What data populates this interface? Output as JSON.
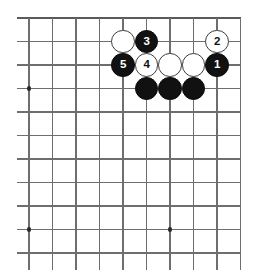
{
  "board": {
    "kind": "go-board-diagram",
    "title": "Go joseki diagram",
    "grid": {
      "columns": 10,
      "rows": 11,
      "origin_x": 29,
      "origin_y": 18,
      "spacing": 23.5,
      "line_color": "#6e6e6e",
      "edge_color": "#5a5a5a",
      "background": "#ffffff"
    },
    "star_points": [
      {
        "col": 0,
        "row": 3
      },
      {
        "col": 0,
        "row": 9
      },
      {
        "col": 6,
        "row": 9
      }
    ],
    "colors": {
      "black_stone": "#111111",
      "white_stone": "#ffffff",
      "white_stone_border": "#3d3d3d",
      "black_label": "#ffffff",
      "white_label": "#111111"
    },
    "stone_radius": 11.8,
    "stones": [
      {
        "id": "stone-w-c4r1",
        "color": "white",
        "label": "",
        "col": 4,
        "row": 1
      },
      {
        "id": "stone-b-3",
        "color": "black",
        "label": "3",
        "col": 5,
        "row": 1
      },
      {
        "id": "stone-w-2",
        "color": "white",
        "label": "2",
        "col": 8,
        "row": 1
      },
      {
        "id": "stone-b-5",
        "color": "black",
        "label": "5",
        "col": 4,
        "row": 2
      },
      {
        "id": "stone-w-4",
        "color": "white",
        "label": "4",
        "col": 5,
        "row": 2
      },
      {
        "id": "stone-w-c6r2",
        "color": "white",
        "label": "",
        "col": 6,
        "row": 2
      },
      {
        "id": "stone-w-c7r2",
        "color": "white",
        "label": "",
        "col": 7,
        "row": 2
      },
      {
        "id": "stone-b-1",
        "color": "black",
        "label": "1",
        "col": 8,
        "row": 2
      },
      {
        "id": "stone-b-c5r3",
        "color": "black",
        "label": "",
        "col": 5,
        "row": 3
      },
      {
        "id": "stone-b-c6r3",
        "color": "black",
        "label": "",
        "col": 6,
        "row": 3
      },
      {
        "id": "stone-b-c7r3",
        "color": "black",
        "label": "",
        "col": 7,
        "row": 3
      }
    ],
    "move_sequence": [
      "1",
      "2",
      "3",
      "4",
      "5"
    ]
  }
}
